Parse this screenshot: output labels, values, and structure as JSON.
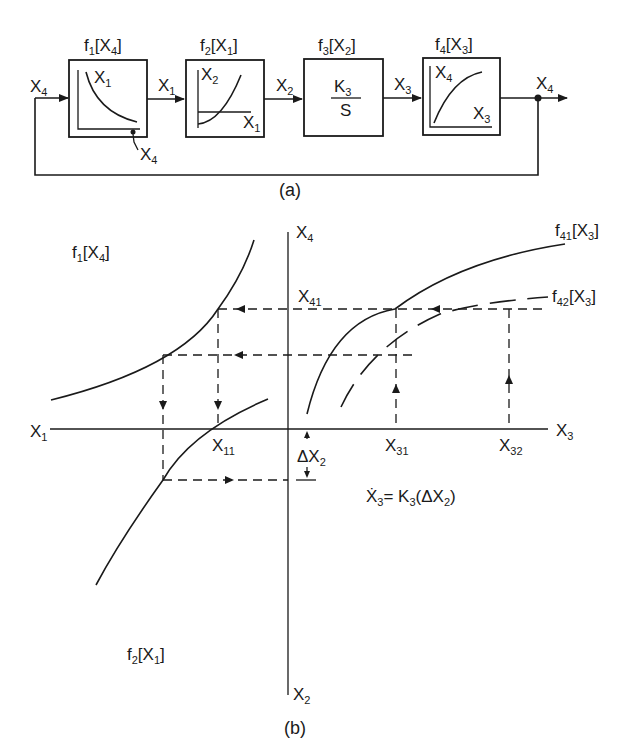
{
  "diagram_a": {
    "caption": "(a)",
    "blocks": [
      {
        "title": "f",
        "title_sub": "1",
        "title_arg": "[X",
        "title_arg_sub": "4",
        "title_close": "]",
        "y_axis": "X",
        "y_axis_sub": "1",
        "x_axis_note": "X",
        "x_axis_note_sub": "4"
      },
      {
        "title": "f",
        "title_sub": "2",
        "title_arg": "[X",
        "title_arg_sub": "1",
        "title_close": "]",
        "y_axis": "X",
        "y_axis_sub": "2",
        "x_axis": "X",
        "x_axis_sub": "1"
      },
      {
        "title": "f",
        "title_sub": "3",
        "title_arg": "[X",
        "title_arg_sub": "2",
        "title_close": "]",
        "numerator": "K",
        "numerator_sub": "3",
        "denominator": "S"
      },
      {
        "title": "f",
        "title_sub": "4",
        "title_arg": "[X",
        "title_arg_sub": "3",
        "title_close": "]",
        "y_axis": "X",
        "y_axis_sub": "4",
        "x_axis": "X",
        "x_axis_sub": "3"
      }
    ],
    "signals": [
      {
        "name": "X",
        "sub": "4"
      },
      {
        "name": "X",
        "sub": "1"
      },
      {
        "name": "X",
        "sub": "2"
      },
      {
        "name": "X",
        "sub": "3"
      },
      {
        "name": "X",
        "sub": "4"
      }
    ]
  },
  "diagram_b": {
    "caption": "(b)",
    "axes": {
      "left": {
        "name": "X",
        "sub": "1"
      },
      "right": {
        "name": "X",
        "sub": "3"
      },
      "top": {
        "name": "X",
        "sub": "4"
      },
      "bottom": {
        "name": "X",
        "sub": "2"
      }
    },
    "curves": [
      {
        "name": "f",
        "sub": "1",
        "arg": "[X",
        "arg_sub": "4",
        "close": "]"
      },
      {
        "name": "f",
        "sub": "2",
        "arg": "[X",
        "arg_sub": "1",
        "close": "]"
      },
      {
        "name": "f",
        "sub": "41",
        "arg": "[X",
        "arg_sub": "3",
        "close": "]"
      },
      {
        "name": "f",
        "sub": "42",
        "arg": "[X",
        "arg_sub": "3",
        "close": "]"
      }
    ],
    "points": {
      "x41": {
        "name": "X",
        "sub": "41"
      },
      "x11": {
        "name": "X",
        "sub": "11"
      },
      "x31": {
        "name": "X",
        "sub": "31"
      },
      "x32": {
        "name": "X",
        "sub": "32"
      },
      "dx2": {
        "name": "ΔX",
        "sub": "2"
      }
    },
    "equation": {
      "lhs": "Ẋ",
      "lhs_sub": "3",
      "eq": "= K",
      "k_sub": "3",
      "rhs": "(ΔX",
      "rhs_sub": "2",
      "close": ")"
    }
  }
}
